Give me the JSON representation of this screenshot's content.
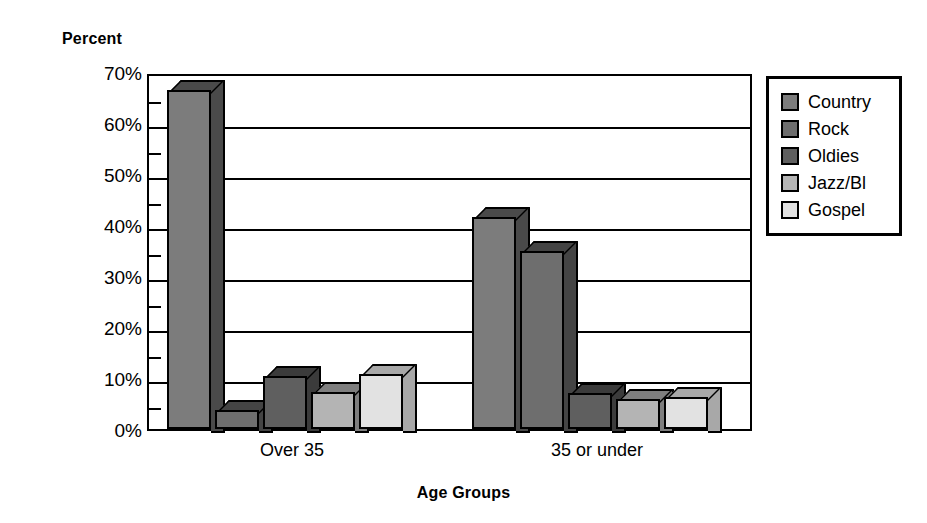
{
  "chart_data": {
    "type": "bar",
    "title": "",
    "xlabel": "Age Groups",
    "ylabel": "Percent",
    "categories": [
      "Over 35",
      "35 or under"
    ],
    "series": [
      {
        "name": "Country",
        "color": "#7c7c7c",
        "side_color": "#4a4a4a",
        "values": [
          66.5,
          41.5
        ]
      },
      {
        "name": "Rock",
        "color": "#6e6e6e",
        "side_color": "#444444",
        "values": [
          3.7,
          35.0
        ]
      },
      {
        "name": "Oldies",
        "color": "#5f5f5f",
        "side_color": "#3b3b3b",
        "values": [
          10.3,
          7.0
        ]
      },
      {
        "name": "Jazz/Bl",
        "color": "#b4b4b4",
        "side_color": "#7e7e7e",
        "values": [
          7.3,
          5.8
        ]
      },
      {
        "name": "Gospel",
        "color": "#e2e2e2",
        "side_color": "#a8a8a8",
        "values": [
          10.8,
          6.3
        ]
      }
    ],
    "ylim": [
      0,
      70
    ],
    "y_ticks": [
      "0%",
      "10%",
      "20%",
      "30%",
      "40%",
      "50%",
      "60%",
      "70%"
    ],
    "y_tick_values": [
      0,
      10,
      20,
      30,
      40,
      50,
      60,
      70
    ],
    "y_minor_tick_values": [
      5,
      15,
      25,
      35,
      45,
      55,
      65
    ],
    "grid": true,
    "legend_position": "right",
    "legend_entries": [
      "Country",
      "Rock",
      "Oldies",
      "Jazz/Bl",
      "Gospel"
    ],
    "axis_color": "#000000",
    "background": "#ffffff"
  }
}
